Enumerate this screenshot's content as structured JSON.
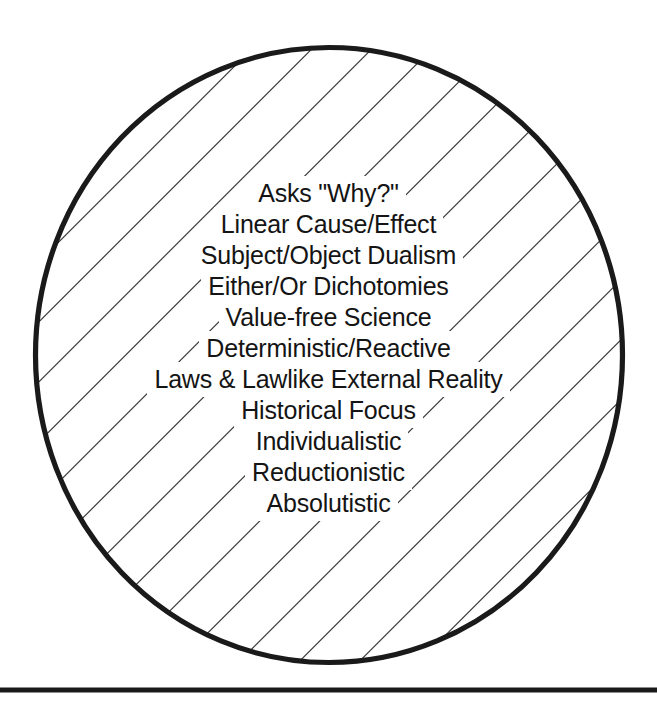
{
  "figure": {
    "name": "hatched-circle-diagram",
    "background_color": "#ffffff",
    "shape": {
      "type": "circle",
      "name": "hatched-circle",
      "center_x": 329,
      "center_y": 355,
      "radius_x": 296,
      "radius_y": 310,
      "outline_color": "#1a1a1a",
      "outline_width": 5,
      "fill_color": "#ffffff"
    },
    "hatching": {
      "name": "diagonal-hatch-fill",
      "angle_degrees": 45,
      "direction": "top-left-to-bottom-right",
      "spacing": 30,
      "line_width": 2,
      "line_color": "#1a1a1a"
    },
    "rule": {
      "name": "bottom-horizontal-rule",
      "y": 690,
      "thickness": 5,
      "color": "#1a1a1a",
      "x_start": 0,
      "x_end": 657
    }
  },
  "labels": {
    "title": "",
    "lines": [
      "Asks \"Why?\"",
      "Linear Cause/Effect",
      "Subject/Object Dualism",
      "Either/Or Dichotomies",
      "Value-free Science",
      "Deterministic/Reactive",
      "Laws & Lawlike External Reality",
      "Historical Focus",
      "Individualistic",
      "Reductionistic",
      "Absolutistic"
    ],
    "text_color": "#141414",
    "alignment": "center"
  }
}
